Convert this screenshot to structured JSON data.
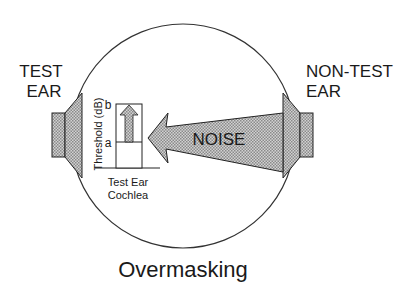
{
  "diagram": {
    "title": "Overmasking",
    "test_ear_label": [
      "TEST",
      "EAR"
    ],
    "nontest_ear_label": [
      "NON-TEST",
      "EAR"
    ],
    "noise_label": "NOISE",
    "cochlea_box": {
      "axis_label": "Threshold (dB)",
      "level_a": "a",
      "level_b": "b",
      "caption": [
        "Test Ear",
        "Cochlea"
      ]
    },
    "colors": {
      "stroke": "#222222",
      "fill_pattern_light": "#d6d6d6",
      "fill_pattern_dark": "#8a8a8a",
      "background": "#ffffff"
    }
  }
}
